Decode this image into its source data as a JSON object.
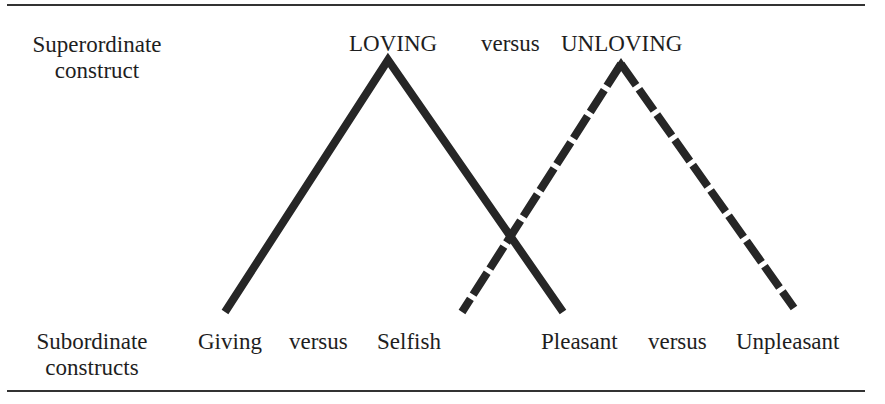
{
  "labels": {
    "superordinate_line1": "Superordinate",
    "superordinate_line2": "construct",
    "subordinate_line1": "Subordinate",
    "subordinate_line2": "constructs"
  },
  "superordinate": {
    "left_pole": "LOVING",
    "connector": "versus",
    "right_pole": "UNLOVING"
  },
  "subordinates": [
    {
      "left_pole": "Giving",
      "connector": "versus",
      "right_pole": "Selfish"
    },
    {
      "left_pole": "Pleasant",
      "connector": "versus",
      "right_pole": "Unpleasant"
    }
  ],
  "lines": {
    "solid_triangle": {
      "apex": [
        388,
        58
      ],
      "left_base": [
        225,
        312
      ],
      "right_base": [
        563,
        312
      ],
      "style": "solid"
    },
    "dashed_triangle": {
      "apex": [
        621,
        62
      ],
      "left_base": [
        462,
        312
      ],
      "right_base": [
        794,
        308
      ],
      "style": "dashed"
    },
    "color": "#262626"
  }
}
